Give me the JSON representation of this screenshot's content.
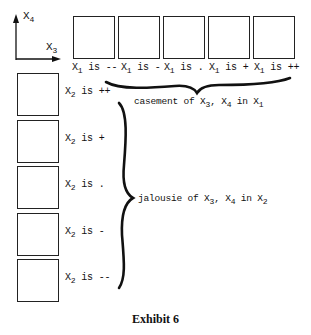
{
  "axes": {
    "vertical_label": "X",
    "vertical_sub": "4",
    "horizontal_label": "X",
    "horizontal_sub": "3"
  },
  "columns": [
    {
      "var": "X",
      "sub": "1",
      "text": " is --"
    },
    {
      "var": "X",
      "sub": "1",
      "text": " is -"
    },
    {
      "var": "X",
      "sub": "1",
      "text": " is ."
    },
    {
      "var": "X",
      "sub": "1",
      "text": " is +"
    },
    {
      "var": "X",
      "sub": "1",
      "text": " is ++"
    }
  ],
  "rows": [
    {
      "var": "X",
      "sub": "2",
      "text": " is ++"
    },
    {
      "var": "X",
      "sub": "2",
      "text": " is +"
    },
    {
      "var": "X",
      "sub": "2",
      "text": " is ."
    },
    {
      "var": "X",
      "sub": "2",
      "text": " is -"
    },
    {
      "var": "X",
      "sub": "2",
      "text": " is --"
    }
  ],
  "casement_note": {
    "prefix": "casement of X",
    "sub_a": "3",
    "mid": ", X",
    "sub_b": "4",
    "suffix": " in X",
    "sub_c": "1"
  },
  "jalousie_note": {
    "prefix": "jalousie of X",
    "sub_a": "3",
    "mid": ", X",
    "sub_b": "4",
    "suffix": " in X",
    "sub_c": "2"
  },
  "caption": "Exhibit 6"
}
